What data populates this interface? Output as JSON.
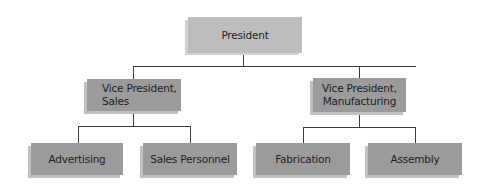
{
  "chart": {
    "type": "org-chart",
    "colors": {
      "top_box": "#bdbdbd",
      "top_shadow": "#d2d2d2",
      "box": "#9b9b9b",
      "shadow": "#c0c0c0",
      "line": "#3a3a3a",
      "text": "#1e1e1e"
    },
    "nodes": {
      "president": {
        "label": "President"
      },
      "vp_sales": {
        "line1": "Vice President,",
        "line2": "Sales"
      },
      "vp_manufacturing": {
        "line1": "Vice President,",
        "line2": "Manufacturing"
      },
      "advertising": {
        "label": "Advertising"
      },
      "sales_personnel": {
        "label": "Sales Personnel"
      },
      "fabrication": {
        "label": "Fabrication"
      },
      "assembly": {
        "label": "Assembly"
      }
    }
  }
}
